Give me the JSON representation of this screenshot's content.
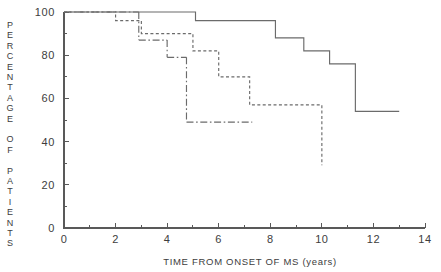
{
  "chart_data": {
    "type": "line",
    "title": "",
    "subtitle": "",
    "xlabel": "TIME FROM ONSET OF MS (years)",
    "ylabel": "PERCENTAGE OF PATIENTS",
    "ylabel_letters": [
      "P",
      "E",
      "R",
      "C",
      "E",
      "N",
      "T",
      "A",
      "G",
      "E",
      "",
      "O",
      "F",
      "",
      "P",
      "A",
      "T",
      "I",
      "E",
      "N",
      "T",
      "S"
    ],
    "xlim": [
      0,
      14
    ],
    "ylim": [
      0,
      100
    ],
    "xticks": [
      0,
      2,
      4,
      6,
      8,
      10,
      12,
      14
    ],
    "xtick_labels": [
      "0",
      "2",
      "4",
      "6",
      "8",
      "10",
      "12",
      "14"
    ],
    "xminorticks": [
      1,
      3,
      5,
      7,
      9,
      11,
      13
    ],
    "yticks": [
      0,
      20,
      40,
      60,
      80,
      100
    ],
    "ytick_labels": [
      "0",
      "20",
      "40",
      "60",
      "80",
      "100"
    ],
    "yminorticks": [
      10,
      30,
      50,
      70,
      90
    ],
    "grid": false,
    "legend": "none",
    "step_type": "post",
    "series": [
      {
        "name": "solid-curve",
        "style": "solid",
        "color": "#6b6b6b",
        "x": [
          0.0,
          5.1,
          5.1,
          8.2,
          8.2,
          9.3,
          9.3,
          10.3,
          10.3,
          11.3,
          11.3,
          13.0
        ],
        "y": [
          100,
          100,
          96,
          96,
          88,
          88,
          82,
          82,
          76,
          76,
          54,
          54
        ],
        "points": [
          {
            "x": 0.0,
            "y": 100
          },
          {
            "x": 5.1,
            "y": 96
          },
          {
            "x": 8.2,
            "y": 88
          },
          {
            "x": 9.3,
            "y": 82
          },
          {
            "x": 10.3,
            "y": 76
          },
          {
            "x": 11.3,
            "y": 54
          },
          {
            "x": 13.0,
            "y": 54
          }
        ]
      },
      {
        "name": "dotted-curve",
        "style": "dotted",
        "color": "#6b6b6b",
        "x": [
          0.0,
          2.0,
          2.0,
          3.0,
          3.0,
          5.0,
          5.0,
          6.0,
          6.0,
          7.2,
          7.2,
          10.0,
          10.0
        ],
        "y": [
          100,
          100,
          96,
          96,
          90,
          90,
          82,
          82,
          70,
          70,
          57,
          57,
          29
        ],
        "points": [
          {
            "x": 0.0,
            "y": 100
          },
          {
            "x": 2.0,
            "y": 96
          },
          {
            "x": 3.0,
            "y": 90
          },
          {
            "x": 5.0,
            "y": 82
          },
          {
            "x": 6.0,
            "y": 70
          },
          {
            "x": 7.2,
            "y": 57
          },
          {
            "x": 10.0,
            "y": 57
          },
          {
            "x": 10.0,
            "y": 29
          }
        ]
      },
      {
        "name": "dash-dot-curve",
        "style": "dashdot",
        "color": "#6b6b6b",
        "x": [
          0.0,
          2.9,
          2.9,
          4.0,
          4.0,
          7.3
        ],
        "y": [
          100,
          100,
          87,
          87,
          79,
          79
        ],
        "points": [
          {
            "x": 0.0,
            "y": 100
          },
          {
            "x": 2.9,
            "y": 87
          },
          {
            "x": 4.0,
            "y": 79
          },
          {
            "x": 4.0,
            "y": 49
          },
          {
            "x": 7.3,
            "y": 49
          }
        ],
        "segments": [
          {
            "x": [
              0.0,
              2.9
            ],
            "y": [
              100,
              100
            ]
          },
          {
            "x": [
              2.9,
              2.9
            ],
            "y": [
              100,
              87
            ]
          },
          {
            "x": [
              2.9,
              4.0
            ],
            "y": [
              87,
              87
            ]
          },
          {
            "x": [
              4.0,
              4.0
            ],
            "y": [
              87,
              79
            ]
          },
          {
            "x": [
              4.0,
              4.75
            ],
            "y": [
              79,
              79
            ]
          },
          {
            "x": [
              4.75,
              4.75
            ],
            "y": [
              79,
              49
            ]
          },
          {
            "x": [
              4.75,
              7.3
            ],
            "y": [
              49,
              49
            ]
          }
        ]
      }
    ]
  }
}
